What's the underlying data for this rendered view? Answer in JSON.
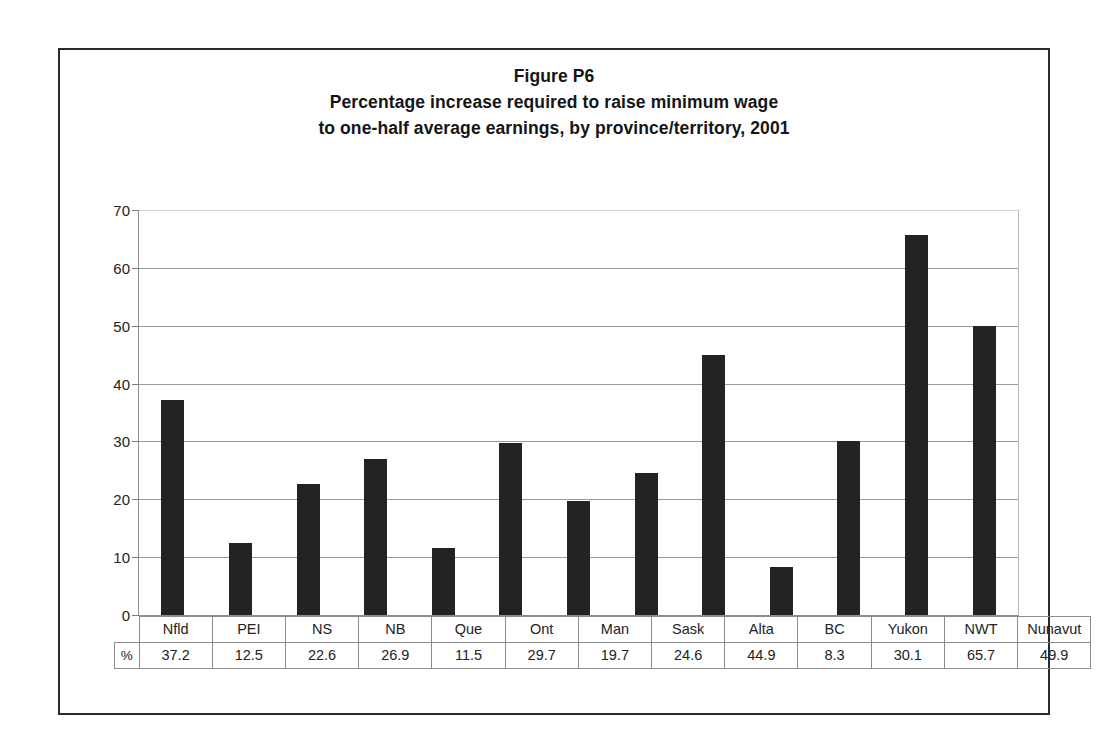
{
  "figure": {
    "title_lines": [
      "Figure P6",
      "Percentage increase required to raise minimum wage",
      "to one-half average earnings, by province/territory, 2001"
    ],
    "unit_label": "%"
  },
  "chart_data": {
    "type": "bar",
    "xlabel": "",
    "ylabel": "",
    "ylim": [
      0,
      70
    ],
    "yticks": [
      0,
      10,
      20,
      30,
      40,
      50,
      60,
      70
    ],
    "grid": true,
    "legend": "none",
    "categories": [
      "Nfld",
      "PEI",
      "NS",
      "NB",
      "Que",
      "Ont",
      "Man",
      "Sask",
      "Alta",
      "BC",
      "Yukon",
      "NWT",
      "Nunavut"
    ],
    "values": [
      37.2,
      12.5,
      22.6,
      26.9,
      11.5,
      29.7,
      19.7,
      24.6,
      44.9,
      8.3,
      30.1,
      65.7,
      49.9
    ],
    "value_labels": [
      "37.2",
      "12.5",
      "22.6",
      "26.9",
      "11.5",
      "29.7",
      "19.7",
      "24.6",
      "44.9",
      "8.3",
      "30.1",
      "65.7",
      "49.9"
    ],
    "tick_labels": [
      "0",
      "10",
      "20",
      "30",
      "40",
      "50",
      "60",
      "70"
    ],
    "bar_color": "#232323"
  }
}
